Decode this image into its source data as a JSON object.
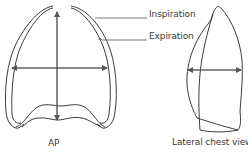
{
  "diagram": {
    "labels": {
      "inspiration": "Inspiration",
      "expiration": "Expiration",
      "ap_view": "AP",
      "lateral_view": "Lateral chest view"
    },
    "colors": {
      "outline": "#3a3a3a",
      "arrow": "#555555",
      "text": "#3a3a3a"
    }
  }
}
